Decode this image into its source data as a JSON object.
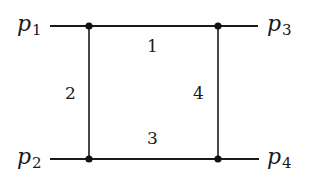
{
  "diagram": {
    "type": "feynman-box-diagram",
    "colors": {
      "line": "#1a1a1a",
      "vertex": "#111111",
      "text": "#1a1a1a",
      "background": "#ffffff"
    },
    "external_legs": [
      {
        "id": "p1",
        "symbol": "p",
        "subscript": "1",
        "position": "top-left"
      },
      {
        "id": "p2",
        "symbol": "p",
        "subscript": "2",
        "position": "bottom-left"
      },
      {
        "id": "p3",
        "symbol": "p",
        "subscript": "3",
        "position": "top-right"
      },
      {
        "id": "p4",
        "symbol": "p",
        "subscript": "4",
        "position": "bottom-right"
      }
    ],
    "internal_propagators": [
      {
        "label": "1",
        "position": "top"
      },
      {
        "label": "2",
        "position": "left"
      },
      {
        "label": "3",
        "position": "bottom"
      },
      {
        "label": "4",
        "position": "right"
      }
    ],
    "vertices": [
      {
        "id": "v-top-left"
      },
      {
        "id": "v-top-right"
      },
      {
        "id": "v-bottom-left"
      },
      {
        "id": "v-bottom-right"
      }
    ]
  }
}
